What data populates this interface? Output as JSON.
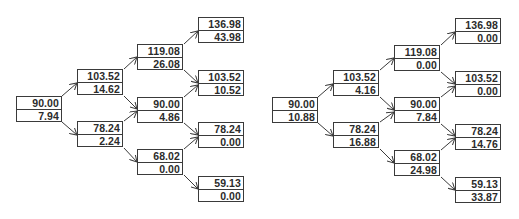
{
  "trees": [
    {
      "name": "left-tree",
      "nodes": {
        "n0": {
          "price": "90.00",
          "value": "7.94"
        },
        "n1u": {
          "price": "103.52",
          "value": "14.62"
        },
        "n1d": {
          "price": "78.24",
          "value": "2.24"
        },
        "n2uu": {
          "price": "119.08",
          "value": "26.08"
        },
        "n2ud": {
          "price": "90.00",
          "value": "4.86"
        },
        "n2dd": {
          "price": "68.02",
          "value": "0.00"
        },
        "n3uuu": {
          "price": "136.98",
          "value": "43.98"
        },
        "n3uud": {
          "price": "103.52",
          "value": "10.52"
        },
        "n3udd": {
          "price": "78.24",
          "value": "0.00"
        },
        "n3ddd": {
          "price": "59.13",
          "value": "0.00"
        }
      }
    },
    {
      "name": "right-tree",
      "nodes": {
        "n0": {
          "price": "90.00",
          "value": "10.88"
        },
        "n1u": {
          "price": "103.52",
          "value": "4.16"
        },
        "n1d": {
          "price": "78.24",
          "value": "16.88"
        },
        "n2uu": {
          "price": "119.08",
          "value": "0.00"
        },
        "n2ud": {
          "price": "90.00",
          "value": "7.84"
        },
        "n2dd": {
          "price": "68.02",
          "value": "24.98"
        },
        "n3uuu": {
          "price": "136.98",
          "value": "0.00"
        },
        "n3uud": {
          "price": "103.52",
          "value": "0.00"
        },
        "n3udd": {
          "price": "78.24",
          "value": "14.76"
        },
        "n3ddd": {
          "price": "59.13",
          "value": "33.87"
        }
      }
    }
  ],
  "colors": {
    "border": "#3a3a3a",
    "text": "#2b2b2b",
    "arrow": "#3a3a3a",
    "background": "#ffffff"
  }
}
